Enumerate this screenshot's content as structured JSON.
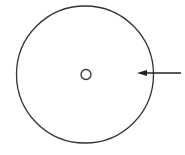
{
  "diagram": {
    "background": "#ffffff",
    "stroke_color": "#333333",
    "outer_circle": {
      "cx": 85,
      "cy": 74.5,
      "r": 68.5
    },
    "center_circle": {
      "cx": 86,
      "cy": 74.5,
      "r": 5
    },
    "arrow": {
      "x1": 181,
      "y1": 73,
      "x2": 137,
      "y2": 73,
      "direction": "left"
    }
  }
}
